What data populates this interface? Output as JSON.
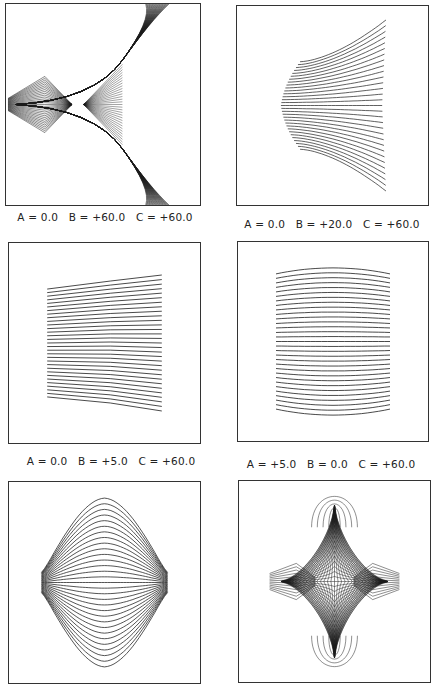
{
  "figure": {
    "panels": [
      {
        "id": 1,
        "caption": "A = 0.0   B = +60.0   C = +60.0",
        "pattern": "cusp-three-branch",
        "box": [
          5,
          3,
          196,
          203
        ],
        "caption_pos": [
          105,
          211
        ]
      },
      {
        "id": 2,
        "caption": "A = 0.0   B = +20.0   C = +60.0",
        "pattern": "fan-right",
        "box": [
          236,
          5,
          193,
          201
        ],
        "caption_pos": [
          332,
          218
        ]
      },
      {
        "id": 3,
        "caption": "A = 0.0   B = +5.0   C = +60.0",
        "pattern": "slanted-lines",
        "box": [
          8,
          242,
          193,
          202
        ],
        "caption_pos": [
          111,
          455
        ]
      },
      {
        "id": 4,
        "caption": "A = +5.0   B = 0.0   C = +60.0",
        "pattern": "barrel-lines",
        "box": [
          237,
          241,
          192,
          201
        ],
        "caption_pos": [
          331,
          458
        ]
      },
      {
        "id": 5,
        "caption": "",
        "pattern": "diamond",
        "box": [
          8,
          481,
          193,
          203
        ],
        "caption_pos": null
      },
      {
        "id": 6,
        "caption": "",
        "pattern": "astroid-star",
        "box": [
          238,
          480,
          193,
          203
        ],
        "caption_pos": null
      }
    ],
    "line_color": "#1a1a1a",
    "line_count": 31
  }
}
